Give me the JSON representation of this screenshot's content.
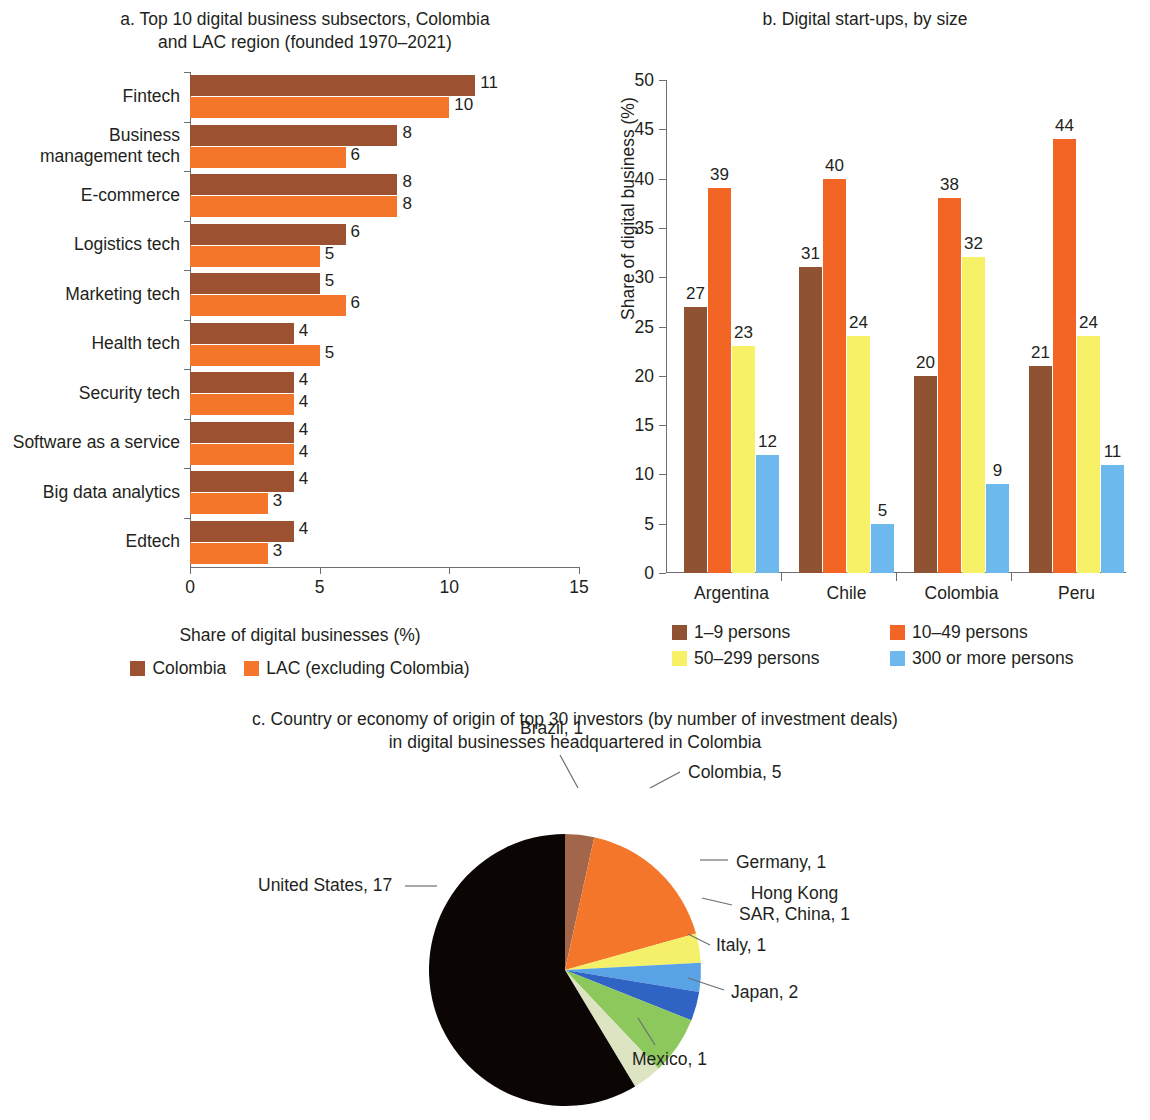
{
  "panel_a": {
    "title": "a. Top 10 digital business subsectors, Colombia and LAC region (founded 1970–2021)",
    "title_line1": "a. Top 10 digital business subsectors, Colombia",
    "title_line2": "and LAC region (founded 1970–2021)",
    "axis_title": "Share of digital businesses (%)",
    "legend": [
      {
        "label": "Colombia",
        "color": "#9c5130"
      },
      {
        "label": "LAC (excluding Colombia)",
        "color": "#f4762a"
      }
    ],
    "x_ticks": [
      "0",
      "5",
      "10",
      "15"
    ]
  },
  "panel_b": {
    "title": "b. Digital start-ups, by size",
    "y_axis_title": "Share of digital business (%)",
    "y_ticks": [
      "0",
      "5",
      "10",
      "15",
      "20",
      "25",
      "30",
      "35",
      "40",
      "45",
      "50"
    ],
    "legend": [
      {
        "label": "1–9 persons",
        "color": "#8f5232"
      },
      {
        "label": "10–49 persons",
        "color": "#f26524"
      },
      {
        "label": "50–299 persons",
        "color": "#f7f167"
      },
      {
        "label": "300 or more persons",
        "color": "#6db8ec"
      }
    ]
  },
  "panel_c": {
    "title_line1": "c. Country or economy of origin of top 30 investors (by number of investment deals)",
    "title_line2": "in digital businesses headquartered in Colombia",
    "title": "c. Country or economy of origin of top 30 investors (by number of investment deals) in digital businesses headquartered in Colombia"
  },
  "chart_data": [
    {
      "id": "a",
      "type": "bar",
      "orientation": "horizontal",
      "title": "a. Top 10 digital business subsectors, Colombia and LAC region (founded 1970–2021)",
      "xlabel": "Share of digital businesses (%)",
      "ylabel": "",
      "xlim": [
        0,
        15
      ],
      "xticks": [
        0,
        5,
        10,
        15
      ],
      "grid": false,
      "legend_position": "bottom",
      "categories": [
        "Fintech",
        "Business management tech",
        "E-commerce",
        "Logistics tech",
        "Marketing tech",
        "Health tech",
        "Security tech",
        "Software as a service",
        "Big data analytics",
        "Edtech"
      ],
      "category_lines": [
        [
          "Fintech"
        ],
        [
          "Business",
          "management tech"
        ],
        [
          "E-commerce"
        ],
        [
          "Logistics tech"
        ],
        [
          "Marketing tech"
        ],
        [
          "Health tech"
        ],
        [
          "Security tech"
        ],
        [
          "Software as a service"
        ],
        [
          "Big data analytics"
        ],
        [
          "Edtech"
        ]
      ],
      "series": [
        {
          "name": "Colombia",
          "color": "#9c5130",
          "values": [
            11,
            8,
            8,
            6,
            5,
            4,
            4,
            4,
            4,
            4
          ]
        },
        {
          "name": "LAC (excluding Colombia)",
          "color": "#f4762a",
          "values": [
            10,
            6,
            8,
            5,
            6,
            5,
            4,
            4,
            3,
            3
          ]
        }
      ]
    },
    {
      "id": "b",
      "type": "bar",
      "orientation": "vertical",
      "title": "b. Digital start-ups, by size",
      "xlabel": "",
      "ylabel": "Share of digital business (%)",
      "ylim": [
        0,
        50
      ],
      "yticks": [
        0,
        5,
        10,
        15,
        20,
        25,
        30,
        35,
        40,
        45,
        50
      ],
      "grid": false,
      "legend_position": "bottom",
      "categories": [
        "Argentina",
        "Chile",
        "Colombia",
        "Peru"
      ],
      "series": [
        {
          "name": "1–9 persons",
          "color": "#8f5232",
          "values": [
            27,
            31,
            20,
            21
          ]
        },
        {
          "name": "10–49 persons",
          "color": "#f26524",
          "values": [
            39,
            40,
            38,
            44
          ]
        },
        {
          "name": "50–299 persons",
          "color": "#f7f167",
          "values": [
            23,
            24,
            32,
            24
          ]
        },
        {
          "name": "300 or more persons",
          "color": "#6db8ec",
          "values": [
            12,
            5,
            9,
            11
          ]
        }
      ]
    },
    {
      "id": "c",
      "type": "pie",
      "title": "c. Country or economy of origin of top 30 investors (by number of investment deals) in digital businesses headquartered in Colombia",
      "total": 29,
      "start_angle_deg": 0,
      "direction": "clockwise",
      "labels": [
        "Brazil, 1",
        "Colombia, 5",
        "Germany, 1",
        "Hong Kong SAR, China, 1",
        "Italy, 1",
        "Japan, 2",
        "Mexico, 1",
        "United States, 17"
      ],
      "slices": [
        {
          "name": "Brazil",
          "value": 1,
          "label": "Brazil, 1",
          "color": "#a4664a"
        },
        {
          "name": "Colombia",
          "value": 5,
          "label": "Colombia, 5",
          "color": "#f4762a"
        },
        {
          "name": "Germany",
          "value": 1,
          "label": "Germany, 1",
          "color": "#f5f06a"
        },
        {
          "name": "Hong Kong SAR, China",
          "value": 1,
          "label": "Hong Kong SAR, China, 1",
          "label_line1": "Hong Kong",
          "label_line2": "SAR, China, 1",
          "color": "#5aa2e6"
        },
        {
          "name": "Italy",
          "value": 1,
          "label": "Italy, 1",
          "color": "#2f63c4"
        },
        {
          "name": "Japan",
          "value": 2,
          "label": "Japan, 2",
          "color": "#8cc85c"
        },
        {
          "name": "Mexico",
          "value": 1,
          "label": "Mexico, 1",
          "color": "#dde4c2"
        },
        {
          "name": "United States",
          "value": 17,
          "label": "United States, 17",
          "color": "#0b0603"
        }
      ]
    }
  ]
}
